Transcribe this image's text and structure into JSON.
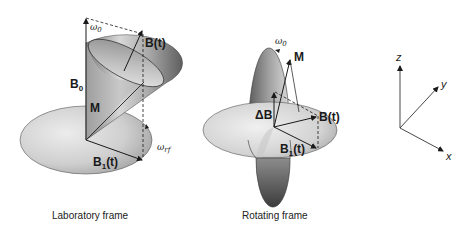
{
  "figure": {
    "lab_frame": {
      "caption": "Laboratory frame",
      "labels": {
        "omega0": "ω",
        "omega0_sub": "0",
        "Bt": "B(t)",
        "B0": "B",
        "B0_sub": "0",
        "M": "M",
        "B1t": "B",
        "B1t_sub": "1",
        "B1t_suffix": "(t)",
        "omega_rf": "ω",
        "omega_rf_sub": "rf"
      }
    },
    "rotating_frame": {
      "caption": "Rotating frame",
      "labels": {
        "omega0": "ω",
        "omega0_sub": "0",
        "M": "M",
        "deltaB": "ΔB",
        "Bt": "B(t)",
        "B1t": "B",
        "B1t_sub": "1",
        "B1t_suffix": "(t)"
      }
    },
    "axes": {
      "z": "z",
      "y": "y",
      "x": "x"
    }
  },
  "colors": {
    "disk_light": "#e4e4e4",
    "disk_dark": "#a8a8a8",
    "cone_dark": "#6e6e6e",
    "line": "#1a1a1a"
  }
}
